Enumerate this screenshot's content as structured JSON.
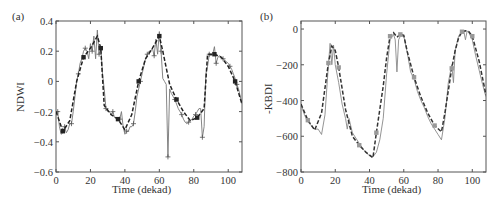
{
  "chart_data": [
    {
      "type": "line",
      "panel_label": "(a)",
      "title": "",
      "xlabel": "Time (dekad)",
      "ylabel": "NDWI",
      "xlim": [
        0,
        108
      ],
      "ylim": [
        -0.6,
        0.4
      ],
      "xticks": [
        0,
        20,
        40,
        60,
        80,
        100
      ],
      "yticks": [
        -0.6,
        -0.4,
        -0.2,
        0,
        0.2,
        0.4
      ],
      "ytick_labels": [
        "−0.6",
        "−0.4",
        "−0.2",
        "0",
        "0.2",
        "0.4"
      ],
      "grid": false,
      "legend": null,
      "series": [
        {
          "name": "observed (raw)",
          "style": "thin solid with + markers",
          "color": "#777777",
          "x": [
            0,
            1,
            2,
            3,
            4,
            5,
            6,
            7,
            8,
            9,
            10,
            11,
            12,
            13,
            14,
            15,
            16,
            17,
            18,
            19,
            20,
            21,
            22,
            23,
            24,
            25,
            26,
            27,
            28,
            29,
            30,
            31,
            32,
            33,
            34,
            35,
            36,
            37,
            38,
            39,
            40,
            41,
            42,
            43,
            44,
            45,
            46,
            47,
            48,
            49,
            50,
            51,
            52,
            53,
            54,
            55,
            56,
            57,
            58,
            59,
            60,
            61,
            62,
            63,
            64,
            65,
            66,
            67,
            68,
            69,
            70,
            71,
            72,
            73,
            74,
            75,
            76,
            77,
            78,
            79,
            80,
            81,
            82,
            83,
            84,
            85,
            86,
            87,
            88,
            89,
            90,
            91,
            92,
            93,
            94,
            95,
            96,
            97,
            98,
            99,
            100,
            101,
            102,
            103,
            104,
            105,
            106,
            107,
            108
          ],
          "y": [
            -0.2,
            -0.2,
            -0.3,
            -0.35,
            -0.34,
            -0.3,
            -0.34,
            -0.32,
            -0.28,
            -0.28,
            -0.2,
            -0.1,
            0.0,
            0.05,
            0.12,
            0.15,
            0.2,
            0.22,
            0.2,
            0.15,
            0.25,
            0.2,
            0.3,
            0.15,
            0.34,
            0.18,
            0.22,
            0.05,
            -0.05,
            -0.18,
            -0.2,
            -0.2,
            -0.22,
            -0.2,
            -0.24,
            -0.24,
            -0.25,
            -0.25,
            -0.2,
            -0.3,
            -0.35,
            -0.33,
            -0.33,
            -0.3,
            -0.3,
            -0.28,
            -0.2,
            -0.1,
            -0.05,
            0.0,
            0.05,
            0.1,
            0.15,
            0.18,
            0.2,
            0.2,
            0.22,
            0.17,
            0.28,
            0.18,
            0.33,
            0.2,
            0.02,
            0.0,
            -0.02,
            -0.5,
            -0.05,
            -0.08,
            -0.1,
            -0.12,
            -0.15,
            -0.18,
            -0.2,
            -0.22,
            -0.25,
            -0.27,
            -0.28,
            -0.27,
            -0.26,
            -0.25,
            -0.23,
            -0.22,
            -0.2,
            -0.18,
            -0.18,
            -0.37,
            -0.3,
            0.05,
            0.1,
            0.18,
            0.17,
            0.18,
            0.23,
            0.12,
            0.16,
            0.17,
            0.16,
            0.15,
            0.14,
            0.13,
            0.12,
            0.1,
            0.08,
            0.05,
            0.02,
            -0.02,
            -0.05,
            -0.1,
            -0.15
          ]
        },
        {
          "name": "smoothed",
          "style": "dashed with filled square markers",
          "color": "#222222",
          "x": [
            0,
            4,
            8,
            12,
            16,
            20,
            24,
            26,
            28,
            32,
            36,
            40,
            44,
            48,
            52,
            56,
            60,
            62,
            66,
            70,
            74,
            78,
            82,
            86,
            88,
            92,
            96,
            100,
            104,
            108
          ],
          "y": [
            -0.2,
            -0.33,
            -0.26,
            0.0,
            0.16,
            0.22,
            0.3,
            0.22,
            -0.16,
            -0.22,
            -0.25,
            -0.32,
            -0.22,
            0.0,
            0.15,
            0.22,
            0.3,
            0.2,
            -0.02,
            -0.12,
            -0.2,
            -0.26,
            -0.24,
            -0.18,
            0.18,
            0.18,
            0.16,
            0.1,
            0.0,
            -0.15
          ]
        }
      ]
    },
    {
      "type": "line",
      "panel_label": "(b)",
      "title": "",
      "xlabel": "Time (dekad)",
      "ylabel": "-KBDI",
      "xlim": [
        0,
        108
      ],
      "ylim": [
        -800,
        45
      ],
      "xticks": [
        0,
        20,
        40,
        60,
        80,
        100
      ],
      "yticks": [
        -800,
        -600,
        -400,
        -200,
        0
      ],
      "ytick_labels": [
        "−800",
        "−600",
        "−400",
        "−200",
        "0"
      ],
      "grid": false,
      "legend": null,
      "series": [
        {
          "name": "observed (raw)",
          "style": "thin solid",
          "color": "#888888",
          "x": [
            0,
            2,
            4,
            6,
            8,
            10,
            12,
            14,
            16,
            17,
            18,
            19,
            20,
            22,
            24,
            26,
            27,
            28,
            30,
            32,
            34,
            36,
            38,
            40,
            42,
            44,
            46,
            48,
            50,
            52,
            54,
            55,
            56,
            57,
            58,
            60,
            62,
            64,
            66,
            68,
            70,
            72,
            74,
            76,
            78,
            80,
            82,
            84,
            86,
            88,
            89,
            90,
            92,
            94,
            95,
            96,
            97,
            98,
            100,
            102,
            104,
            106,
            108
          ],
          "y": [
            -420,
            -480,
            -520,
            -540,
            -560,
            -560,
            -590,
            -480,
            -200,
            -80,
            -200,
            -90,
            -200,
            -300,
            -420,
            -500,
            -560,
            -500,
            -580,
            -610,
            -640,
            -670,
            -690,
            -710,
            -715,
            -690,
            -620,
            -500,
            -250,
            -60,
            -30,
            -60,
            -240,
            -60,
            -40,
            -40,
            -130,
            -240,
            -280,
            -350,
            -400,
            -440,
            -490,
            -530,
            -560,
            -590,
            -620,
            -500,
            -300,
            -200,
            -300,
            -120,
            -40,
            -10,
            -10,
            -60,
            -10,
            -20,
            -60,
            -150,
            -230,
            -310,
            -380
          ]
        },
        {
          "name": "smoothed",
          "style": "dashed with filled square markers",
          "color": "#333333",
          "x": [
            0,
            4,
            8,
            12,
            16,
            18,
            20,
            22,
            26,
            30,
            34,
            38,
            42,
            44,
            48,
            50,
            52,
            54,
            56,
            58,
            60,
            62,
            66,
            70,
            74,
            78,
            82,
            84,
            88,
            90,
            92,
            94,
            96,
            98,
            100,
            104,
            108
          ],
          "y": [
            -420,
            -510,
            -565,
            -470,
            -190,
            -95,
            -120,
            -215,
            -450,
            -600,
            -650,
            -690,
            -720,
            -580,
            -320,
            -160,
            -40,
            -20,
            -45,
            -30,
            -35,
            -125,
            -270,
            -380,
            -470,
            -540,
            -575,
            -470,
            -220,
            -120,
            -50,
            -15,
            -10,
            -15,
            -40,
            -180,
            -370
          ]
        }
      ]
    }
  ],
  "panels": {
    "a": {
      "label": "(a)",
      "xlabel": "Time (dekad)",
      "ylabel": "NDWI"
    },
    "b": {
      "label": "(b)",
      "xlabel": "Time (dekad)",
      "ylabel": "-KBDI"
    }
  }
}
